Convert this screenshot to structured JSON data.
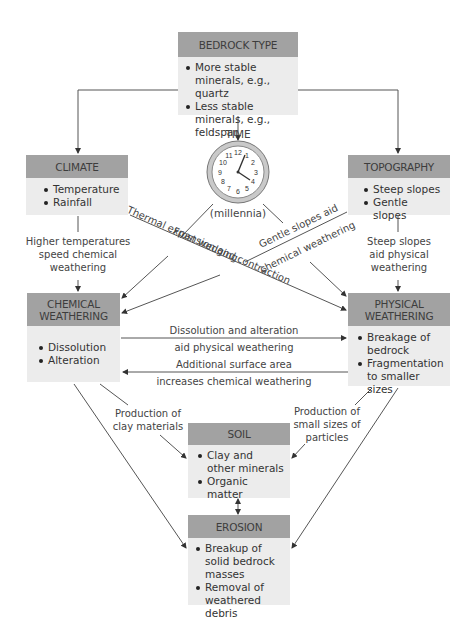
{
  "boxes": {
    "bedrock": {
      "title": "BEDROCK TYPE",
      "items": [
        "More stable minerals, e.g., quartz",
        "Less stable minerals, e.g., feldspar"
      ]
    },
    "climate": {
      "title": "CLIMATE",
      "items": [
        "Temperature",
        "Rainfall"
      ]
    },
    "topography": {
      "title": "TOPOGRAPHY",
      "items": [
        "Steep slopes",
        "Gentle slopes"
      ]
    },
    "chemical": {
      "title_line1": "CHEMICAL",
      "title_line2": "WEATHERING",
      "items": [
        "Dissolution",
        "Alteration"
      ]
    },
    "physical": {
      "title_line1": "PHYSICAL",
      "title_line2": "WEATHERING",
      "items": [
        "Breakage of bedrock",
        "Fragmentation to smaller sizes"
      ]
    },
    "soil": {
      "title": "SOIL",
      "items": [
        "Clay and other minerals",
        "Organic matter"
      ]
    },
    "erosion": {
      "title": "EROSION",
      "items": [
        "Breakup of solid bedrock masses",
        "Removal of weathered debris"
      ]
    }
  },
  "time": {
    "title": "TIME",
    "subtitle": "(millennia)",
    "clock_numbers": [
      "12",
      "1",
      "2",
      "3",
      "4",
      "5",
      "6",
      "7",
      "8",
      "9",
      "10",
      "11"
    ]
  },
  "labels": {
    "climate_to_chemical": [
      "Higher temperatures",
      "speed chemical",
      "weathering"
    ],
    "topo_to_physical": [
      "Steep slopes",
      "aid physical",
      "weathering"
    ],
    "frost": "Frost wedging",
    "thermal": "Thermal expansion and contraction",
    "gentle_1": "Gentle slopes aid",
    "gentle_2": "chemical weathering",
    "chem_to_phys_1": "Dissolution and alteration",
    "chem_to_phys_2": "aid physical weathering",
    "phys_to_chem_1": "Additional surface area",
    "phys_to_chem_2": "increases chemical weathering",
    "clay_1": "Production of",
    "clay_2": "clay materials",
    "small_1": "Production of",
    "small_2": "small sizes of",
    "small_3": "particles"
  },
  "colors": {
    "header": "#a2a2a2",
    "body": "#ececec",
    "line": "#555555",
    "clock_rim": "#b5b5b5"
  }
}
